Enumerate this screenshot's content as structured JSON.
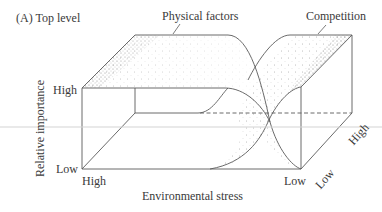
{
  "panel_label": "(A)  Top level",
  "surfaces": {
    "physical_factors": "Physical factors",
    "competition": "Competition"
  },
  "axes": {
    "y": {
      "label": "Relative importance",
      "high": "High",
      "low": "Low"
    },
    "x": {
      "label": "Environmental stress",
      "high": "High",
      "low": "Low"
    },
    "z": {
      "high": "High",
      "low": "Low"
    }
  },
  "colors": {
    "line": "#5a5a5a",
    "stipple": "#6b6b6b",
    "text": "#3a3a3a",
    "artifact_line": "#d0d0d0"
  }
}
